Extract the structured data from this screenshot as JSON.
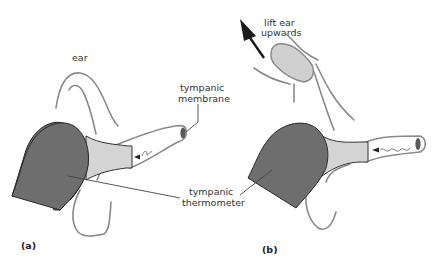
{
  "panels": [
    {
      "id": "a",
      "label": "(a)",
      "annotations": {
        "ear": "ear",
        "tympanic_membrane_line1": "tympanic",
        "tympanic_membrane_line2": "membrane"
      }
    },
    {
      "id": "b",
      "label": "(b)",
      "annotations": {
        "lift_line1": "lift ear",
        "lift_line2": "upwards"
      }
    }
  ],
  "shared_label": {
    "line1": "tympanic",
    "line2": "thermometer"
  },
  "colors": {
    "thermometer_body": "#6e6e6e",
    "probe": "#d4d4d4",
    "ear_outline": "#8a8a8a",
    "membrane": "#5a5a5a",
    "arrow": "#1a1a1a",
    "lifted_ear": "#d0d0d0"
  }
}
